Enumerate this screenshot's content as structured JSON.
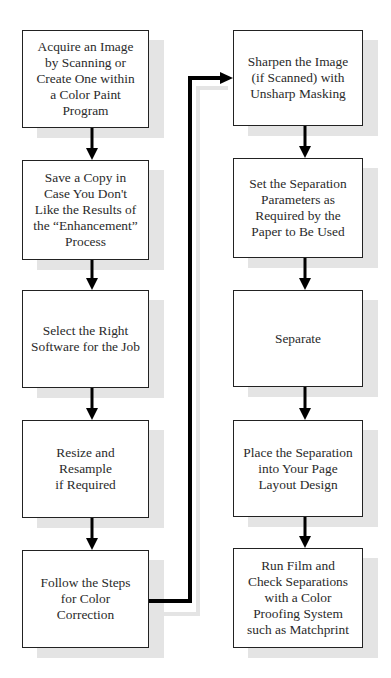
{
  "diagram": {
    "type": "flowchart",
    "columns": [
      {
        "steps": [
          {
            "id": "L1",
            "label": "Acquire an Image by Scanning or Create One within a Color Paint Program",
            "lines": [
              "Acquire an Image",
              "by Scanning or",
              "Create One within",
              "a Color Paint",
              "Program"
            ]
          },
          {
            "id": "L2",
            "label": "Save a Copy in Case You Don't Like the Results of the “Enhancement” Process",
            "lines": [
              "Save a Copy in",
              "Case You Don't",
              "Like the Results of",
              "the “Enhancement”",
              "Process"
            ]
          },
          {
            "id": "L3",
            "label": "Select the Right Software for the Job",
            "lines": [
              "Select the Right",
              "Software for the Job"
            ]
          },
          {
            "id": "L4",
            "label": "Resize and Resample if Required",
            "lines": [
              "Resize and Resample",
              "if Required"
            ]
          },
          {
            "id": "L5",
            "label": "Follow the Steps for Color Correction",
            "lines": [
              "Follow the Steps",
              "for Color",
              "Correction"
            ]
          }
        ]
      },
      {
        "steps": [
          {
            "id": "R1",
            "label": "Sharpen the Image (if Scanned) with Unsharp Masking",
            "lines": [
              "Sharpen the Image",
              "(if Scanned) with",
              "Unsharp Masking"
            ]
          },
          {
            "id": "R2",
            "label": "Set the Separation Parameters as Required by the Paper to Be Used",
            "lines": [
              "Set the Separation",
              "Parameters as",
              "Required by the",
              "Paper to Be Used"
            ]
          },
          {
            "id": "R3",
            "label": "Separate",
            "lines": [
              "Separate"
            ]
          },
          {
            "id": "R4",
            "label": "Place the Separation into Your Page Layout Design",
            "lines": [
              "Place the Separation",
              "into Your Page",
              "Layout Design"
            ]
          },
          {
            "id": "R5",
            "label": "Run Film and Check Separations with a Color Proofing System such as Matchprint",
            "lines": [
              "Run Film and",
              "Check Separations",
              "with a Color",
              "Proofing System",
              "such as Matchprint"
            ]
          }
        ]
      }
    ],
    "edges": [
      {
        "from": "L1",
        "to": "L2"
      },
      {
        "from": "L2",
        "to": "L3"
      },
      {
        "from": "L3",
        "to": "L4"
      },
      {
        "from": "L4",
        "to": "L5"
      },
      {
        "from": "L5",
        "to": "R1"
      },
      {
        "from": "R1",
        "to": "R2"
      },
      {
        "from": "R2",
        "to": "R3"
      },
      {
        "from": "R3",
        "to": "R4"
      },
      {
        "from": "R4",
        "to": "R5"
      }
    ],
    "colors": {
      "box_border": "#222222",
      "box_fill": "#ffffff",
      "shadow": "#e4e4e4",
      "arrow": "#000000",
      "text": "#2a2a2a"
    }
  }
}
